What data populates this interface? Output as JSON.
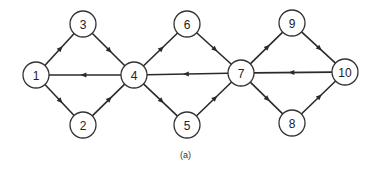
{
  "caption": "(a)",
  "node_radius": 13,
  "nodes": [
    {
      "id": "1",
      "label": "1",
      "x": 36,
      "y": 75
    },
    {
      "id": "2",
      "label": "2",
      "x": 83,
      "y": 125
    },
    {
      "id": "3",
      "label": "3",
      "x": 83,
      "y": 24
    },
    {
      "id": "4",
      "label": "4",
      "x": 134,
      "y": 75
    },
    {
      "id": "5",
      "label": "5",
      "x": 187,
      "y": 125
    },
    {
      "id": "6",
      "label": "6",
      "x": 187,
      "y": 24
    },
    {
      "id": "7",
      "label": "7",
      "x": 241,
      "y": 73
    },
    {
      "id": "8",
      "label": "8",
      "x": 292,
      "y": 123
    },
    {
      "id": "9",
      "label": "9",
      "x": 292,
      "y": 23
    },
    {
      "id": "10",
      "label": "10",
      "x": 345,
      "y": 72
    }
  ],
  "edges": [
    {
      "from": "1",
      "to": "3"
    },
    {
      "from": "1",
      "to": "2"
    },
    {
      "from": "3",
      "to": "4"
    },
    {
      "from": "2",
      "to": "4"
    },
    {
      "from": "4",
      "to": "1"
    },
    {
      "from": "4",
      "to": "6"
    },
    {
      "from": "4",
      "to": "5"
    },
    {
      "from": "6",
      "to": "7"
    },
    {
      "from": "5",
      "to": "7"
    },
    {
      "from": "7",
      "to": "4"
    },
    {
      "from": "7",
      "to": "9"
    },
    {
      "from": "7",
      "to": "8"
    },
    {
      "from": "9",
      "to": "10"
    },
    {
      "from": "8",
      "to": "10"
    },
    {
      "from": "10",
      "to": "7"
    }
  ]
}
